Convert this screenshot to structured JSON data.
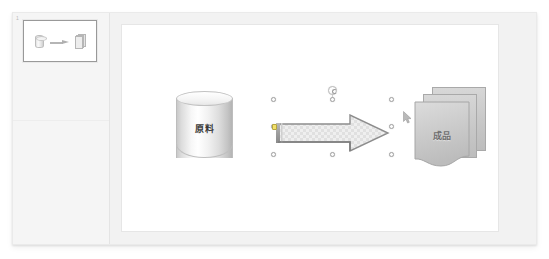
{
  "window": {
    "title": "Presentation Editor",
    "background_color": "#f2f2f2",
    "frame_color": "#f4f4f4"
  },
  "thumbnail_pane": {
    "name": "slide-thumbnail-pane",
    "background_color": "#f5f5f5",
    "slide_number": "1",
    "slides": [
      {
        "number": "1",
        "selected": true,
        "shapes": [
          "cylinder-icon",
          "arrow-icon",
          "documents-icon"
        ]
      }
    ]
  },
  "slide": {
    "name": "slide-canvas",
    "background_color": "#ffffff",
    "shapes": [
      {
        "id": "cylinder",
        "type": "cylinder",
        "label": "原料",
        "label_color": "#3a3a3a",
        "fill": "gradient-silver",
        "selected": false
      },
      {
        "id": "block-arrow",
        "type": "right-arrow",
        "label": "",
        "fill": "checker-texture",
        "fill_color": "#e8e8e8",
        "outline_color": "#8a8a8a",
        "selected": true,
        "handles": {
          "resize_count": 8,
          "rotation_handle": true,
          "adjustment_handle": true,
          "adjustment_handle_color": "#f2e06a"
        }
      },
      {
        "id": "document-stack",
        "type": "stacked-documents",
        "label": "成品",
        "label_color": "#6e6e6e",
        "fill": "gradient-gray",
        "count": 3,
        "selected": false
      }
    ]
  },
  "cursor": {
    "name": "mouse-cursor",
    "type": "arrow-pointer",
    "x": "281",
    "y": "86"
  }
}
